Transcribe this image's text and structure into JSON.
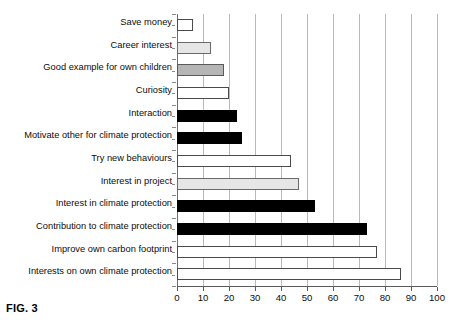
{
  "figure": {
    "caption": "FIG. 3"
  },
  "chart_data": {
    "type": "bar",
    "orientation": "horizontal",
    "title": "",
    "subtitle": "",
    "xlabel": "",
    "ylabel": "",
    "xlim": [
      0,
      100
    ],
    "xticks": [
      0,
      10,
      20,
      30,
      40,
      50,
      60,
      70,
      80,
      90,
      100
    ],
    "xtick_labels": [
      "0",
      "10",
      "20",
      "30",
      "40",
      "50",
      "60",
      "70",
      "80",
      "90",
      "100"
    ],
    "grid": "vertical",
    "legend": "none",
    "categories": [
      "Save money",
      "Career interest",
      "Good example for own children",
      "Curiosity",
      "Interaction",
      "Motivate other for climate protection",
      "Try new behaviours",
      "Interest in project",
      "Interest in climate protection",
      "Contribution to climate protection",
      "Improve own carbon footprint",
      "Interests on own climate protection"
    ],
    "values": [
      6,
      13,
      18,
      20,
      23,
      25,
      44,
      47,
      53,
      73,
      77,
      86
    ],
    "fills": [
      "white",
      "light-gray",
      "medium-gray",
      "white",
      "black",
      "black",
      "white",
      "light-gray",
      "black",
      "black",
      "white",
      "white"
    ],
    "bars": [
      {
        "label": "Save money",
        "value": 6,
        "fill": "white"
      },
      {
        "label": "Career interest",
        "value": 13,
        "fill": "light-gray"
      },
      {
        "label": "Good example for own children",
        "value": 18,
        "fill": "medium-gray"
      },
      {
        "label": "Curiosity",
        "value": 20,
        "fill": "white"
      },
      {
        "label": "Interaction",
        "value": 23,
        "fill": "black"
      },
      {
        "label": "Motivate other for climate protection",
        "value": 25,
        "fill": "black"
      },
      {
        "label": "Try new behaviours",
        "value": 44,
        "fill": "white"
      },
      {
        "label": "Interest in project",
        "value": 47,
        "fill": "light-gray"
      },
      {
        "label": "Interest in climate protection",
        "value": 53,
        "fill": "black"
      },
      {
        "label": "Contribution to climate protection",
        "value": 73,
        "fill": "black"
      },
      {
        "label": "Improve own carbon footprint",
        "value": 77,
        "fill": "white"
      },
      {
        "label": "Interests on own climate protection",
        "value": 86,
        "fill": "white"
      }
    ],
    "colors": {
      "white": "#ffffff",
      "light-gray": "#e6e6e6",
      "medium-gray": "#b5b5b5",
      "black": "#000000",
      "gridline": "#b9b9b9",
      "axis": "#5a5a5a",
      "text": "#0d0d0d"
    }
  }
}
